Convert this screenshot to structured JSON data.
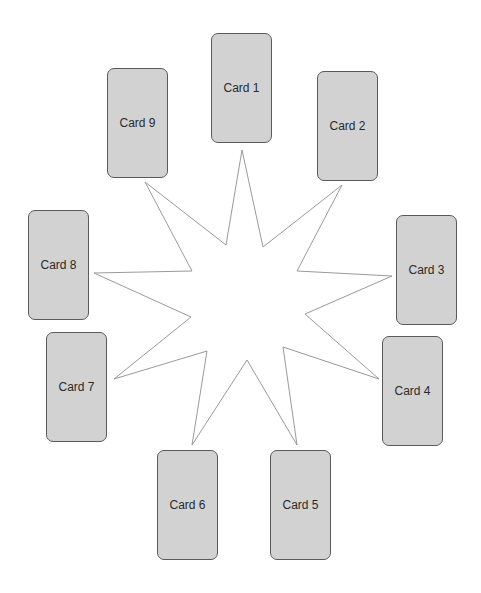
{
  "diagram": {
    "type": "star-card-spread",
    "star": {
      "points": 9,
      "stroke": "#9a9a9a",
      "fill": "#ffffff",
      "polygon": "242,150 263,247 342,185 297,271 392,276 305,314 379,379 283,347 297,445 247,360 192,445 207,351 114,379 191,317 94,273 192,271 145,182 226,245"
    },
    "cards": [
      {
        "label": "Card 1",
        "x": 211,
        "y": 33
      },
      {
        "label": "Card 2",
        "x": 317,
        "y": 71
      },
      {
        "label": "Card 3",
        "x": 396,
        "y": 215
      },
      {
        "label": "Card 4",
        "x": 382,
        "y": 336
      },
      {
        "label": "Card 5",
        "x": 270,
        "y": 450
      },
      {
        "label": "Card 6",
        "x": 157,
        "y": 450
      },
      {
        "label": "Card 7",
        "x": 46,
        "y": 332
      },
      {
        "label": "Card 8",
        "x": 28,
        "y": 210
      },
      {
        "label": "Card 9",
        "x": 107,
        "y": 68
      }
    ],
    "colors": {
      "card_fill": "#d2d2d2",
      "card_border": "#5a5a5a",
      "text": "#2a2a2a"
    }
  }
}
